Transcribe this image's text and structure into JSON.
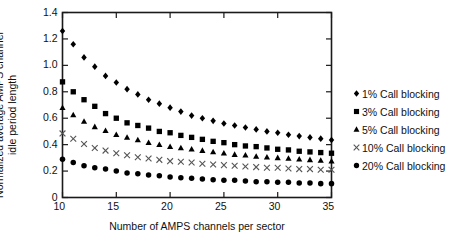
{
  "chart_data": {
    "type": "scatter",
    "title": "",
    "xlabel": "Number of AMPS channels per sector",
    "ylabel_line1": "Normalized average AMPS channel",
    "ylabel_line2": "idle period length",
    "xlim": [
      10,
      35
    ],
    "ylim": [
      0,
      1.4
    ],
    "xticks": [
      10,
      15,
      20,
      25,
      30,
      35
    ],
    "xticklabels": [
      "10",
      "15",
      "20",
      "25",
      "30",
      "35"
    ],
    "yticks": [
      0,
      0.2,
      0.4,
      0.6,
      0.8,
      1.0,
      1.2,
      1.4
    ],
    "yticklabels": [
      "0",
      "0.2",
      "0.4",
      "0.6",
      "0.8",
      "1.0",
      "1.2",
      "1.4"
    ],
    "grid": false,
    "legend_position": "right",
    "x": [
      10,
      11,
      12,
      13,
      14,
      15,
      16,
      17,
      18,
      19,
      20,
      21,
      22,
      23,
      24,
      25,
      26,
      27,
      28,
      29,
      30,
      31,
      32,
      33,
      34,
      35
    ],
    "series": [
      {
        "name": "1% Call blocking",
        "marker": "diamond",
        "color": "#000000",
        "values": [
          1.26,
          1.16,
          1.06,
          0.99,
          0.92,
          0.87,
          0.82,
          0.78,
          0.74,
          0.71,
          0.68,
          0.65,
          0.62,
          0.6,
          0.58,
          0.56,
          0.545,
          0.53,
          0.515,
          0.5,
          0.49,
          0.475,
          0.465,
          0.455,
          0.445,
          0.435
        ]
      },
      {
        "name": "3% Call blocking",
        "marker": "square",
        "color": "#000000",
        "values": [
          0.875,
          0.8,
          0.74,
          0.69,
          0.635,
          0.6,
          0.565,
          0.545,
          0.525,
          0.5,
          0.49,
          0.47,
          0.455,
          0.44,
          0.425,
          0.415,
          0.4,
          0.39,
          0.385,
          0.375,
          0.365,
          0.36,
          0.35,
          0.345,
          0.34,
          0.335
        ]
      },
      {
        "name": "5% Call blocking",
        "marker": "triangle",
        "color": "#000000",
        "values": [
          0.68,
          0.625,
          0.575,
          0.535,
          0.505,
          0.475,
          0.455,
          0.435,
          0.415,
          0.4,
          0.385,
          0.375,
          0.365,
          0.355,
          0.345,
          0.335,
          0.325,
          0.32,
          0.31,
          0.305,
          0.3,
          0.295,
          0.29,
          0.285,
          0.28,
          0.275
        ]
      },
      {
        "name": "10% Call blocking",
        "marker": "cross",
        "color": "#555555",
        "values": [
          0.485,
          0.445,
          0.405,
          0.375,
          0.355,
          0.335,
          0.32,
          0.305,
          0.295,
          0.285,
          0.275,
          0.27,
          0.265,
          0.255,
          0.25,
          0.245,
          0.24,
          0.235,
          0.23,
          0.225,
          0.225,
          0.22,
          0.215,
          0.215,
          0.21,
          0.21
        ]
      },
      {
        "name": "20% Call blocking",
        "marker": "circle",
        "color": "#000000",
        "values": [
          0.29,
          0.265,
          0.24,
          0.225,
          0.215,
          0.2,
          0.185,
          0.18,
          0.17,
          0.165,
          0.155,
          0.15,
          0.145,
          0.14,
          0.135,
          0.13,
          0.13,
          0.125,
          0.12,
          0.12,
          0.115,
          0.115,
          0.11,
          0.11,
          0.105,
          0.105
        ]
      }
    ]
  },
  "legend": {
    "items": [
      {
        "marker": "diamond",
        "label": "1% Call blocking"
      },
      {
        "marker": "square",
        "label": "3% Call blocking"
      },
      {
        "marker": "triangle",
        "label": "5% Call blocking"
      },
      {
        "marker": "cross",
        "label": "10% Call blocking"
      },
      {
        "marker": "circle",
        "label": "20% Call blocking"
      }
    ]
  }
}
